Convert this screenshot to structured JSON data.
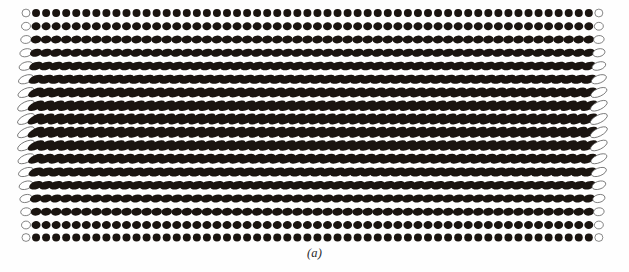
{
  "figure": {
    "caption": "(a)",
    "background_color": "#fefefe",
    "molecule_fill_color": "#1a1410",
    "boundary_fill_color": "#ffffff",
    "boundary_stroke_color": "#555555"
  },
  "lattice": {
    "columns": 58,
    "rows": 18,
    "origin_x": 26,
    "origin_y": 13,
    "column_spacing": 10.05,
    "row_spacing": 13.25,
    "semi_minor_axis": 3.9,
    "boundary_column_indices": [
      0,
      57
    ],
    "stroke_width": 0.7
  },
  "chart_data": {
    "type": "scatter",
    "xlabel": "",
    "ylabel": "",
    "rows": [
      {
        "row": 0,
        "y": 13.0,
        "tilt_deg": 0,
        "semi_major_axis": 4.0,
        "elongation": 1.03
      },
      {
        "row": 1,
        "y": 26.25,
        "tilt_deg": -4,
        "semi_major_axis": 4.5,
        "elongation": 1.15
      },
      {
        "row": 2,
        "y": 39.5,
        "tilt_deg": -9,
        "semi_major_axis": 5.3,
        "elongation": 1.36
      },
      {
        "row": 3,
        "y": 52.75,
        "tilt_deg": -14,
        "semi_major_axis": 6.2,
        "elongation": 1.59
      },
      {
        "row": 4,
        "y": 66.0,
        "tilt_deg": -18,
        "semi_major_axis": 7.1,
        "elongation": 1.82
      },
      {
        "row": 5,
        "y": 79.25,
        "tilt_deg": -21,
        "semi_major_axis": 7.9,
        "elongation": 2.03
      },
      {
        "row": 6,
        "y": 92.5,
        "tilt_deg": -24,
        "semi_major_axis": 8.6,
        "elongation": 2.21
      },
      {
        "row": 7,
        "y": 105.75,
        "tilt_deg": -26,
        "semi_major_axis": 9.1,
        "elongation": 2.33
      },
      {
        "row": 8,
        "y": 119.0,
        "tilt_deg": -27,
        "semi_major_axis": 9.3,
        "elongation": 2.38
      },
      {
        "row": 9,
        "y": 132.25,
        "tilt_deg": -27,
        "semi_major_axis": 9.3,
        "elongation": 2.38
      },
      {
        "row": 10,
        "y": 145.5,
        "tilt_deg": -26,
        "semi_major_axis": 9.1,
        "elongation": 2.33
      },
      {
        "row": 11,
        "y": 158.75,
        "tilt_deg": -24,
        "semi_major_axis": 8.6,
        "elongation": 2.21
      },
      {
        "row": 12,
        "y": 172.0,
        "tilt_deg": -21,
        "semi_major_axis": 7.9,
        "elongation": 2.03
      },
      {
        "row": 13,
        "y": 185.25,
        "tilt_deg": -18,
        "semi_major_axis": 7.1,
        "elongation": 1.82
      },
      {
        "row": 14,
        "y": 198.5,
        "tilt_deg": -14,
        "semi_major_axis": 6.2,
        "elongation": 1.59
      },
      {
        "row": 15,
        "y": 211.75,
        "tilt_deg": -9,
        "semi_major_axis": 5.3,
        "elongation": 1.36
      },
      {
        "row": 16,
        "y": 225.0,
        "tilt_deg": -4,
        "semi_major_axis": 4.5,
        "elongation": 1.15
      },
      {
        "row": 17,
        "y": 237.5,
        "tilt_deg": 0,
        "semi_major_axis": 4.0,
        "elongation": 1.03
      }
    ]
  }
}
